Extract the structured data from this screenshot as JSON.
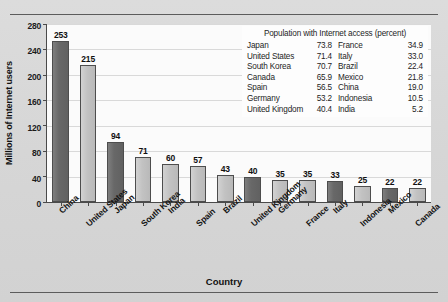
{
  "chart_data": {
    "type": "bar",
    "title": "",
    "xlabel": "Country",
    "ylabel": "Millions of Internet users",
    "ylim": [
      0,
      280
    ],
    "ytick_step": 40,
    "grid": true,
    "categories": [
      "China",
      "United States",
      "Japan",
      "South Korea",
      "India",
      "Spain",
      "Brazil",
      "United Kingdom",
      "Germany",
      "France",
      "Italy",
      "Indonesia",
      "Mexico",
      "Canada"
    ],
    "values": [
      253,
      215,
      94,
      71,
      60,
      57,
      43,
      40,
      35,
      35,
      33,
      25,
      22,
      22
    ],
    "yticks": [
      "0",
      "40",
      "80",
      "120",
      "160",
      "200",
      "240",
      "280"
    ],
    "bar_colors": [
      "dark",
      "light",
      "dark",
      "light",
      "light",
      "light",
      "light",
      "dark",
      "light",
      "light",
      "dark",
      "light",
      "dark",
      "light"
    ],
    "colors": {
      "bar_dark": "#686868",
      "bar_light": "#c2c2c2",
      "bar_edge": "#4d4d4d",
      "plot_background": "#fbfbfb",
      "figure_background": "#d6d6d6",
      "axis": "#4a4a4a",
      "gridline": "#d9d9d9",
      "text": "#111111"
    },
    "inset_table": {
      "title": "Population with Internet access (percent)",
      "left_column": [
        {
          "country": "Japan",
          "percent": "73.8"
        },
        {
          "country": "United States",
          "percent": "71.4"
        },
        {
          "country": "South Korea",
          "percent": "70.7"
        },
        {
          "country": "Canada",
          "percent": "65.9"
        },
        {
          "country": "Spain",
          "percent": "56.5"
        },
        {
          "country": "Germany",
          "percent": "53.2"
        },
        {
          "country": "United Kingdom",
          "percent": "40.4"
        }
      ],
      "right_column": [
        {
          "country": "France",
          "percent": "34.9"
        },
        {
          "country": "Italy",
          "percent": "33.0"
        },
        {
          "country": "Brazil",
          "percent": "22.4"
        },
        {
          "country": "Mexico",
          "percent": "21.8"
        },
        {
          "country": "China",
          "percent": "19.0"
        },
        {
          "country": "Indonesia",
          "percent": "10.5"
        },
        {
          "country": "India",
          "percent": "5.2"
        }
      ]
    }
  }
}
